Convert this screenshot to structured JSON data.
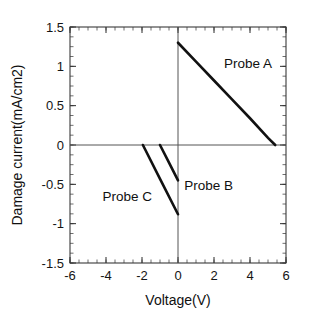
{
  "chart_data": {
    "type": "line",
    "title": "",
    "xlabel": "Voltage(V)",
    "ylabel": "Damage current(mA/cm2)",
    "xlim": [
      -6,
      6
    ],
    "ylim": [
      -1.5,
      1.5
    ],
    "xticks": [
      -6,
      -4,
      -2,
      0,
      2,
      4,
      6
    ],
    "xtick_labels": [
      "-6",
      "-4",
      "-2",
      "0",
      "2",
      "4",
      "6"
    ],
    "yticks": [
      -1.5,
      -1,
      -0.5,
      0,
      0.5,
      1,
      1.5
    ],
    "ytick_labels": [
      "-1.5",
      "-1",
      "-0.5",
      "0",
      "0.5",
      "1",
      "1.5"
    ],
    "xtick_minor_step": 0.5,
    "ytick_minor_step": 0.125,
    "grid": false,
    "legend": "inline-annotations",
    "series": [
      {
        "name": "Probe A",
        "label": "Probe A",
        "label_x": 2.55,
        "label_y": 1.04,
        "x": [
          0.0,
          5.4
        ],
        "y": [
          1.3,
          0.0
        ],
        "points": [
          [
            0.0,
            1.3
          ],
          [
            1.0,
            1.06
          ],
          [
            2.0,
            0.82
          ],
          [
            3.0,
            0.58
          ],
          [
            4.0,
            0.34
          ],
          [
            5.0,
            0.09
          ],
          [
            5.4,
            0.0
          ]
        ]
      },
      {
        "name": "Probe B",
        "label": "Probe B",
        "label_x": 0.35,
        "label_y": -0.52,
        "x": [
          -1.0,
          0.0
        ],
        "y": [
          0.0,
          -0.45
        ],
        "points": [
          [
            -1.0,
            0.0
          ],
          [
            -0.5,
            -0.225
          ],
          [
            0.0,
            -0.45
          ]
        ]
      },
      {
        "name": "Probe C",
        "label": "Probe C",
        "label_x": -4.2,
        "label_y": -0.66,
        "x": [
          -1.95,
          0.0
        ],
        "y": [
          0.0,
          -0.88
        ],
        "points": [
          [
            -1.95,
            0.0
          ],
          [
            -1.0,
            -0.43
          ],
          [
            0.0,
            -0.88
          ]
        ]
      }
    ],
    "axis_colors": {
      "line": "#111111",
      "frame": "#3a3a3a",
      "text": "#101010",
      "background": "#ffffff"
    }
  }
}
